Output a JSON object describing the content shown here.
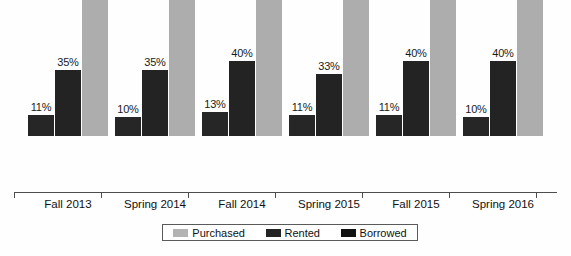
{
  "chart_data": {
    "type": "bar",
    "title": "",
    "subtitle": "",
    "xlabel": "",
    "ylabel": "",
    "ylim": [
      0,
      100
    ],
    "grid": false,
    "legend_position": "bottom",
    "value_suffix": "%",
    "categories": [
      "Fall 2013",
      "Spring 2014",
      "Fall 2014",
      "Spring 2015",
      "Fall 2015",
      "Spring 2016"
    ],
    "series": [
      {
        "name": "Borrowed",
        "color": "#262626",
        "values": [
          11,
          10,
          13,
          11,
          11,
          10
        ],
        "labels": [
          "11%",
          "10%",
          "13%",
          "11%",
          "11%",
          "10%"
        ]
      },
      {
        "name": "Rented",
        "color": "#232323",
        "values": [
          35,
          35,
          40,
          33,
          40,
          40
        ],
        "labels": [
          "35%",
          "35%",
          "40%",
          "33%",
          "40%",
          "40%"
        ]
      },
      {
        "name": "Purchased",
        "color": "#adadad",
        "values": [
          89,
          84,
          86,
          85,
          86,
          82
        ],
        "labels": [
          "89%",
          "84%",
          "86%",
          "85%",
          "86%",
          "82%"
        ]
      }
    ],
    "legend": [
      {
        "label": "Purchased",
        "color": "#b3b3b3"
      },
      {
        "label": "Rented",
        "color": "#232323"
      },
      {
        "label": "Borrowed",
        "color": "#111111"
      }
    ]
  },
  "groups": [
    {
      "category": "Fall 2013",
      "bars": [
        {
          "series": "Borrowed",
          "label": "11%"
        },
        {
          "series": "Rented",
          "label": "35%"
        },
        {
          "series": "Purchased",
          "label": "89%"
        }
      ]
    },
    {
      "category": "Spring 2014",
      "bars": [
        {
          "series": "Borrowed",
          "label": "10%"
        },
        {
          "series": "Rented",
          "label": "35%"
        },
        {
          "series": "Purchased",
          "label": "84%"
        }
      ]
    },
    {
      "category": "Fall 2014",
      "bars": [
        {
          "series": "Borrowed",
          "label": "13%"
        },
        {
          "series": "Rented",
          "label": "40%"
        },
        {
          "series": "Purchased",
          "label": "86%"
        }
      ]
    },
    {
      "category": "Spring 2015",
      "bars": [
        {
          "series": "Borrowed",
          "label": "11%"
        },
        {
          "series": "Rented",
          "label": "33%"
        },
        {
          "series": "Purchased",
          "label": "85%"
        }
      ]
    },
    {
      "category": "Fall 2015",
      "bars": [
        {
          "series": "Borrowed",
          "label": "11%"
        },
        {
          "series": "Rented",
          "label": "40%"
        },
        {
          "series": "Purchased",
          "label": "86%"
        }
      ]
    },
    {
      "category": "Spring 2016",
      "bars": [
        {
          "series": "Borrowed",
          "label": "10%"
        },
        {
          "series": "Rented",
          "label": "40%"
        },
        {
          "series": "Purchased",
          "label": "82%"
        }
      ]
    }
  ]
}
